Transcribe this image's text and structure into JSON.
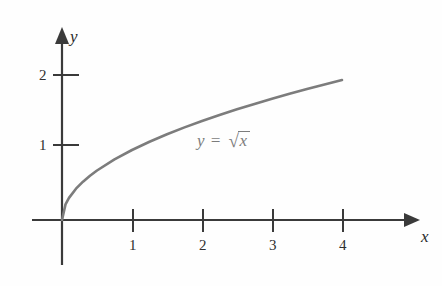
{
  "figure": {
    "background_color": "#fefefe",
    "axis_color": "#3a3a3a",
    "curve_color": "#7c7c7c",
    "label_color": "#2e2e2e"
  },
  "axes": {
    "x_name": "x",
    "y_name": "y",
    "x_ticks": [
      {
        "label": "1",
        "value": 1
      },
      {
        "label": "2",
        "value": 2
      },
      {
        "label": "3",
        "value": 3
      },
      {
        "label": "4",
        "value": 4
      }
    ],
    "y_ticks": [
      {
        "label": "1",
        "value": 1
      },
      {
        "label": "2",
        "value": 2
      }
    ]
  },
  "annotation": {
    "lhs": "y",
    "equals": "=",
    "radical": "√",
    "radicand": "x",
    "full_text": "y = √x"
  },
  "chart_data": {
    "type": "line",
    "title": "",
    "xlabel": "x",
    "ylabel": "y",
    "xlim": [
      0,
      4
    ],
    "ylim": [
      0,
      2
    ],
    "grid": false,
    "legend": null,
    "annotations": [
      {
        "text": "y = √x",
        "x": 2.0,
        "y": 1.07
      }
    ],
    "xticks": [
      1,
      2,
      3,
      4
    ],
    "yticks": [
      1,
      2
    ],
    "series": [
      {
        "name": "y = √x",
        "color": "#7c7c7c",
        "x": [
          0,
          0.05,
          0.1,
          0.2,
          0.3,
          0.4,
          0.5,
          0.75,
          1.0,
          1.25,
          1.5,
          1.75,
          2.0,
          2.25,
          2.5,
          2.75,
          3.0,
          3.25,
          3.5,
          3.75,
          4.0
        ],
        "y": [
          0,
          0.2236,
          0.3162,
          0.4472,
          0.5477,
          0.6325,
          0.7071,
          0.866,
          1.0,
          1.118,
          1.2247,
          1.3229,
          1.4142,
          1.5,
          1.5811,
          1.6583,
          1.7321,
          1.8028,
          1.8708,
          1.9365,
          2.0
        ]
      }
    ]
  }
}
